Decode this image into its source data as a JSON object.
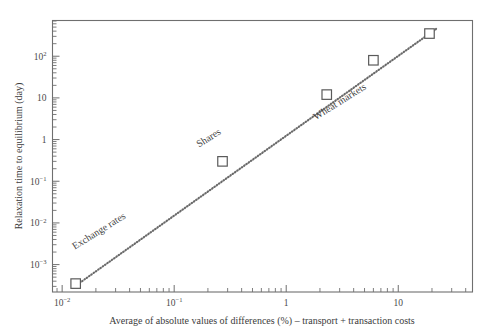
{
  "chart_data": {
    "type": "scatter",
    "title": "",
    "xlabel": "Average of absolute values of differences (%) – transport + transaction costs",
    "ylabel": "Relaxation time to equilibrium (day)",
    "xscale": "log",
    "yscale": "log",
    "xlim": [
      0.0082,
      46
    ],
    "ylim": [
      0.00022,
      720
    ],
    "grid": false,
    "legend": "none",
    "xticks": [
      {
        "value": 0.01,
        "label": "10",
        "exp": "−2"
      },
      {
        "value": 0.1,
        "label": "10",
        "exp": "−1"
      },
      {
        "value": 1,
        "label": "1",
        "exp": ""
      },
      {
        "value": 10,
        "label": "10",
        "exp": ""
      }
    ],
    "yticks": [
      {
        "value": 100,
        "label": "10",
        "exp": "2"
      },
      {
        "value": 10,
        "label": "10",
        "exp": ""
      },
      {
        "value": 1,
        "label": "1",
        "exp": ""
      },
      {
        "value": 0.1,
        "label": "10",
        "exp": "−1"
      },
      {
        "value": 0.01,
        "label": "10",
        "exp": "−2"
      },
      {
        "value": 0.001,
        "label": "10",
        "exp": "−3"
      }
    ],
    "marker_style": "open-square",
    "points": [
      {
        "name": "exchange-rates",
        "x": 0.0132,
        "y": 0.00035
      },
      {
        "name": "shares",
        "x": 0.27,
        "y": 0.3
      },
      {
        "name": "wheat-markets-1",
        "x": 2.3,
        "y": 12.0
      },
      {
        "name": "wheat-markets-2",
        "x": 6.0,
        "y": 80.0
      },
      {
        "name": "wheat-markets-3",
        "x": 19.0,
        "y": 350.0
      }
    ],
    "annotations": [
      {
        "name": "exchange-rates",
        "text": "Exchange rates",
        "x": 0.022,
        "y": 0.0055,
        "rotation": -32
      },
      {
        "name": "shares",
        "text": "Shares",
        "x": 0.21,
        "y": 0.95,
        "rotation": -32
      },
      {
        "name": "wheat-markets",
        "text": "Wheat markets",
        "x": 3.1,
        "y": 7.0,
        "rotation": -32
      }
    ],
    "trendline": {
      "name": "dotted-power-law-fit",
      "style": "dotted",
      "x_start": 0.0125,
      "y_start": 0.00028,
      "x_end": 22.0,
      "y_end": 460.0
    }
  }
}
